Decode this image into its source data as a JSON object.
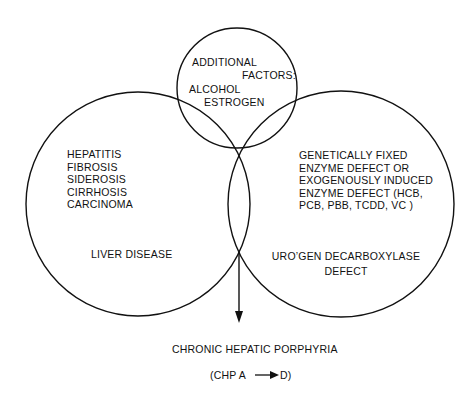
{
  "diagram": {
    "type": "venn",
    "circles": {
      "top": {
        "title_lines": [
          "ADDITIONAL",
          "FACTORS:"
        ],
        "items": [
          "ALCOHOL",
          "ESTROGEN"
        ]
      },
      "left": {
        "items": [
          "HEPATITIS",
          "FIBROSIS",
          "SIDEROSIS",
          "CIRRHOSIS",
          "CARCINOMA"
        ],
        "label": "LIVER DISEASE"
      },
      "right": {
        "description_lines": [
          "GENETICALLY  FIXED",
          "ENZYME DEFECT OR",
          "EXOGENOUSLY INDUCED",
          "ENZYME DEFECT (HCB,",
          "PCB, PBB, TCDD, VC )"
        ],
        "label_lines": [
          "URO’GEN DECARBOXYLASE",
          "DEFECT"
        ]
      }
    },
    "outcome": {
      "title": "CHRONIC HEPATIC PORPHYRIA",
      "subtitle_left": "(CHP A",
      "subtitle_right": "D)"
    },
    "colors": {
      "stroke": "#111111",
      "background": "#ffffff"
    }
  }
}
